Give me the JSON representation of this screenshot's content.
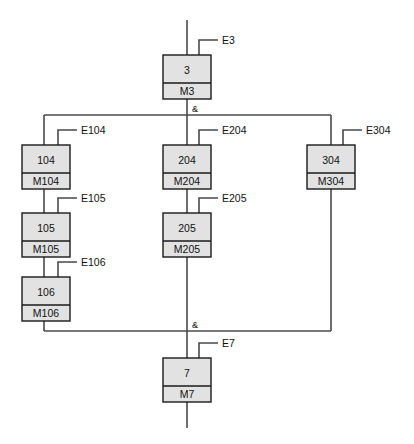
{
  "diagram": {
    "fill_color": "#e2e2e2",
    "line_color": "#4a4a4a",
    "border_color": "#1a1a1a",
    "sync_symbol": "&",
    "blocks": [
      {
        "id": "b3",
        "top": "3",
        "bottom": "M3",
        "input": "E3",
        "x": 163,
        "y": 55,
        "w": 48,
        "h": 44,
        "divider": 28
      },
      {
        "id": "b104",
        "top": "104",
        "bottom": "M104",
        "input": "E104",
        "x": 22,
        "y": 145,
        "w": 48,
        "h": 44,
        "divider": 28
      },
      {
        "id": "b105",
        "top": "105",
        "bottom": "M105",
        "input": "E105",
        "x": 22,
        "y": 213,
        "w": 48,
        "h": 44,
        "divider": 28
      },
      {
        "id": "b106",
        "top": "106",
        "bottom": "M106",
        "input": "E106",
        "x": 22,
        "y": 277,
        "w": 48,
        "h": 44,
        "divider": 28
      },
      {
        "id": "b204",
        "top": "204",
        "bottom": "M204",
        "input": "E204",
        "x": 163,
        "y": 145,
        "w": 48,
        "h": 44,
        "divider": 28
      },
      {
        "id": "b205",
        "top": "205",
        "bottom": "M205",
        "input": "E205",
        "x": 163,
        "y": 213,
        "w": 48,
        "h": 44,
        "divider": 28
      },
      {
        "id": "b304",
        "top": "304",
        "bottom": "M304",
        "input": "E304",
        "x": 307,
        "y": 145,
        "w": 48,
        "h": 44,
        "divider": 28
      },
      {
        "id": "b7",
        "top": "7",
        "bottom": "M7",
        "input": "E7",
        "x": 163,
        "y": 358,
        "w": 48,
        "h": 44,
        "divider": 28
      }
    ],
    "sync_bars": [
      {
        "id": "fork",
        "label": "&",
        "y": 115,
        "x1": 44,
        "x2": 331
      },
      {
        "id": "join",
        "label": "&",
        "y": 331,
        "x1": 44,
        "x2": 331
      }
    ],
    "input_labels": [
      "E3",
      "E104",
      "E105",
      "E106",
      "E204",
      "E205",
      "E304",
      "E7"
    ]
  }
}
